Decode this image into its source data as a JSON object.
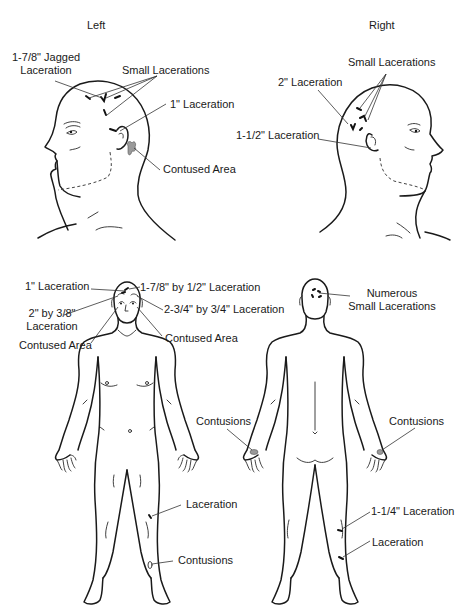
{
  "diagram": {
    "type": "injury-body-chart",
    "views": {
      "left_head": {
        "title": "Left",
        "labels": {
          "jagged": "1-7/8\" Jagged\nLaceration",
          "jagged_l1": "1-7/8\" Jagged",
          "jagged_l2": "Laceration",
          "small": "Small Lacerations",
          "one_inch": "1\" Laceration",
          "contused": "Contused Area"
        }
      },
      "right_head": {
        "title": "Right",
        "labels": {
          "small": "Small Lacerations",
          "two_inch": "2\" Laceration",
          "one_half": "1-1/2\" Laceration"
        }
      },
      "front_body": {
        "labels": {
          "one_inch": "1\" Laceration",
          "seven_eighths": "1-7/8\" by 1/2\" Laceration",
          "two_by_l1": "2\" by 3/8\"",
          "two_by_l2": "Laceration",
          "three_quarter": "2-3/4\" by 3/4\" Laceration",
          "contused_left": "Contused Area",
          "contused_right": "Contused Area",
          "thigh": "Laceration",
          "shin": "Contusions"
        }
      },
      "back_body": {
        "labels": {
          "numerous_l1": "Numerous",
          "numerous_l2": "Small Lacerations",
          "hand_left": "Contusions",
          "hand_right": "Contusions",
          "calf": "1-1/4\" Laceration",
          "ankle": "Laceration"
        }
      }
    },
    "colors": {
      "line": "#1a1a1a",
      "bruise_fill": "#9a9a9a",
      "background": "#ffffff"
    }
  }
}
